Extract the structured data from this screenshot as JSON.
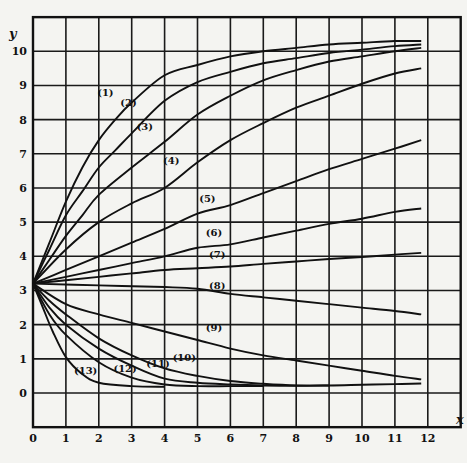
{
  "chart_data": {
    "type": "line",
    "title": "",
    "xlabel": "x",
    "ylabel": "y",
    "xlim": [
      0,
      13
    ],
    "ylim": [
      -1,
      11
    ],
    "grid": true,
    "legend": "none (curves labeled inline with numbers in parentheses)",
    "x_ticks": [
      "0",
      "1",
      "2",
      "3",
      "4",
      "5",
      "6",
      "7",
      "8",
      "9",
      "10",
      "11",
      "12"
    ],
    "y_ticks": [
      "0",
      "1",
      "2",
      "3",
      "4",
      "5",
      "6",
      "7",
      "8",
      "9",
      "10"
    ],
    "start_point": {
      "x": 0,
      "y": 3.2
    },
    "series": [
      {
        "name": "(1)",
        "label_pos": [
          2.2,
          8.7
        ],
        "points": [
          [
            0,
            3.2
          ],
          [
            0.5,
            4.4
          ],
          [
            1,
            5.6
          ],
          [
            1.5,
            6.6
          ],
          [
            2,
            7.4
          ],
          [
            2.5,
            8.0
          ],
          [
            3,
            8.5
          ],
          [
            4,
            9.3
          ],
          [
            5,
            9.6
          ],
          [
            6,
            9.85
          ],
          [
            7,
            10.0
          ],
          [
            8,
            10.1
          ],
          [
            9,
            10.2
          ],
          [
            10,
            10.25
          ],
          [
            11,
            10.3
          ],
          [
            11.8,
            10.3
          ]
        ]
      },
      {
        "name": "(2)",
        "label_pos": [
          2.9,
          8.4
        ],
        "points": [
          [
            0,
            3.2
          ],
          [
            0.5,
            4.2
          ],
          [
            1,
            5.2
          ],
          [
            1.5,
            5.9
          ],
          [
            2,
            6.6
          ],
          [
            2.5,
            7.1
          ],
          [
            3,
            7.6
          ],
          [
            4,
            8.55
          ],
          [
            5,
            9.1
          ],
          [
            6,
            9.4
          ],
          [
            7,
            9.65
          ],
          [
            8,
            9.8
          ],
          [
            9,
            9.95
          ],
          [
            10,
            10.05
          ],
          [
            11,
            10.15
          ],
          [
            11.8,
            10.2
          ]
        ]
      },
      {
        "name": "(3)",
        "label_pos": [
          3.4,
          7.7
        ],
        "points": [
          [
            0,
            3.2
          ],
          [
            0.5,
            3.9
          ],
          [
            1,
            4.6
          ],
          [
            1.5,
            5.2
          ],
          [
            2,
            5.8
          ],
          [
            3,
            6.6
          ],
          [
            4,
            7.35
          ],
          [
            5,
            8.15
          ],
          [
            6,
            8.7
          ],
          [
            7,
            9.15
          ],
          [
            8,
            9.45
          ],
          [
            9,
            9.7
          ],
          [
            10,
            9.85
          ],
          [
            11,
            10.0
          ],
          [
            11.8,
            10.1
          ]
        ]
      },
      {
        "name": "(4)",
        "label_pos": [
          4.2,
          6.7
        ],
        "points": [
          [
            0,
            3.2
          ],
          [
            1,
            4.2
          ],
          [
            2,
            5.0
          ],
          [
            3,
            5.55
          ],
          [
            4,
            6.0
          ],
          [
            5,
            6.75
          ],
          [
            6,
            7.4
          ],
          [
            7,
            7.9
          ],
          [
            8,
            8.35
          ],
          [
            9,
            8.7
          ],
          [
            10,
            9.05
          ],
          [
            11,
            9.35
          ],
          [
            11.8,
            9.5
          ]
        ]
      },
      {
        "name": "(5)",
        "label_pos": [
          5.3,
          5.6
        ],
        "points": [
          [
            0,
            3.2
          ],
          [
            1,
            3.6
          ],
          [
            2,
            4.0
          ],
          [
            3,
            4.4
          ],
          [
            4,
            4.8
          ],
          [
            5,
            5.25
          ],
          [
            6,
            5.5
          ],
          [
            7,
            5.85
          ],
          [
            8,
            6.2
          ],
          [
            9,
            6.55
          ],
          [
            10,
            6.85
          ],
          [
            11,
            7.15
          ],
          [
            11.8,
            7.4
          ]
        ]
      },
      {
        "name": "(6)",
        "label_pos": [
          5.5,
          4.6
        ],
        "points": [
          [
            0,
            3.2
          ],
          [
            1,
            3.4
          ],
          [
            2,
            3.6
          ],
          [
            3,
            3.8
          ],
          [
            4,
            4.0
          ],
          [
            5,
            4.25
          ],
          [
            6,
            4.35
          ],
          [
            7,
            4.55
          ],
          [
            8,
            4.75
          ],
          [
            9,
            4.95
          ],
          [
            10,
            5.1
          ],
          [
            11,
            5.3
          ],
          [
            11.8,
            5.4
          ]
        ]
      },
      {
        "name": "(7)",
        "label_pos": [
          5.6,
          3.95
        ],
        "points": [
          [
            0,
            3.2
          ],
          [
            1,
            3.3
          ],
          [
            2,
            3.4
          ],
          [
            3,
            3.5
          ],
          [
            4,
            3.6
          ],
          [
            5,
            3.65
          ],
          [
            6,
            3.7
          ],
          [
            7,
            3.78
          ],
          [
            8,
            3.85
          ],
          [
            9,
            3.92
          ],
          [
            10,
            3.98
          ],
          [
            11,
            4.05
          ],
          [
            11.8,
            4.1
          ]
        ]
      },
      {
        "name": "(8)",
        "label_pos": [
          5.6,
          3.05
        ],
        "points": [
          [
            0,
            3.2
          ],
          [
            2,
            3.15
          ],
          [
            4,
            3.1
          ],
          [
            5,
            3.05
          ],
          [
            6,
            2.9
          ],
          [
            7,
            2.8
          ],
          [
            8,
            2.7
          ],
          [
            9,
            2.6
          ],
          [
            10,
            2.5
          ],
          [
            11,
            2.4
          ],
          [
            11.8,
            2.3
          ]
        ]
      },
      {
        "name": "(9)",
        "label_pos": [
          5.5,
          1.8
        ],
        "points": [
          [
            0,
            3.2
          ],
          [
            1,
            2.6
          ],
          [
            2,
            2.3
          ],
          [
            3,
            2.05
          ],
          [
            4,
            1.8
          ],
          [
            5,
            1.55
          ],
          [
            6,
            1.3
          ],
          [
            7,
            1.1
          ],
          [
            8,
            0.95
          ],
          [
            9,
            0.8
          ],
          [
            10,
            0.65
          ],
          [
            11,
            0.5
          ],
          [
            11.8,
            0.4
          ]
        ]
      },
      {
        "name": "(10)",
        "label_pos": [
          4.6,
          0.95
        ],
        "points": [
          [
            0,
            3.2
          ],
          [
            0.5,
            2.7
          ],
          [
            1,
            2.3
          ],
          [
            2,
            1.6
          ],
          [
            3,
            1.1
          ],
          [
            4,
            0.72
          ],
          [
            5,
            0.5
          ],
          [
            6,
            0.35
          ],
          [
            7,
            0.27
          ],
          [
            8,
            0.22
          ],
          [
            9,
            0.22
          ],
          [
            10,
            0.24
          ],
          [
            11,
            0.26
          ],
          [
            11.8,
            0.28
          ]
        ]
      },
      {
        "name": "(11)",
        "label_pos": [
          3.8,
          0.75
        ],
        "points": [
          [
            0,
            3.2
          ],
          [
            0.5,
            2.5
          ],
          [
            1,
            2.0
          ],
          [
            2,
            1.3
          ],
          [
            3,
            0.8
          ],
          [
            4,
            0.42
          ],
          [
            5,
            0.3
          ],
          [
            6,
            0.25
          ],
          [
            7,
            0.22
          ],
          [
            8,
            0.21
          ],
          [
            9,
            0.22
          ]
        ]
      },
      {
        "name": "(12)",
        "label_pos": [
          2.8,
          0.6
        ],
        "points": [
          [
            0,
            3.2
          ],
          [
            0.5,
            2.3
          ],
          [
            1,
            1.7
          ],
          [
            2,
            0.9
          ],
          [
            3,
            0.45
          ],
          [
            4,
            0.25
          ],
          [
            5,
            0.2
          ],
          [
            6,
            0.2
          ],
          [
            7,
            0.2
          ]
        ]
      },
      {
        "name": "(13)",
        "label_pos": [
          1.6,
          0.55
        ],
        "points": [
          [
            0,
            3.2
          ],
          [
            0.3,
            2.5
          ],
          [
            0.6,
            1.8
          ],
          [
            1,
            1.05
          ],
          [
            1.5,
            0.55
          ],
          [
            2,
            0.3
          ],
          [
            3,
            0.2
          ],
          [
            4,
            0.18
          ]
        ]
      }
    ]
  }
}
